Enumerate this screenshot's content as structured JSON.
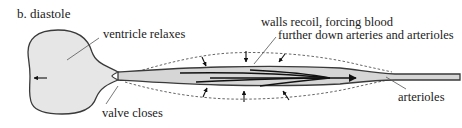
{
  "diagram": {
    "title": "b. diastole",
    "labels": {
      "ventricle": "ventricle relaxes",
      "walls_line1": "walls recoil, forcing blood",
      "walls_line2": "further down arteries and arterioles",
      "valve": "valve closes",
      "arterioles": "arterioles"
    },
    "colors": {
      "fill": "#e6e6e6",
      "vessel_fill": "#d6d6d6",
      "stroke": "#3a3a3a"
    }
  }
}
